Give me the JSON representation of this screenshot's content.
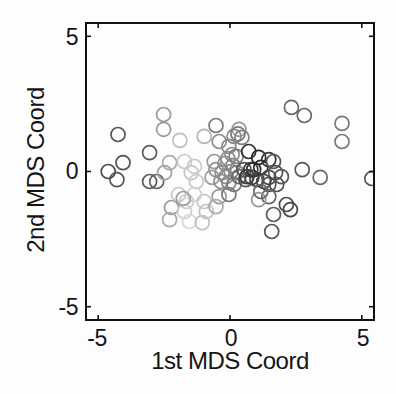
{
  "chart_data": {
    "type": "scatter",
    "title": "",
    "xlabel": "1st MDS Coord",
    "ylabel": "2nd MDS Coord",
    "xlim": [
      -5.5,
      5.5
    ],
    "ylim": [
      -5.53,
      5.53
    ],
    "x_tick_values": [
      -5,
      0,
      5
    ],
    "y_tick_values": [
      -5,
      0,
      5
    ],
    "x_tick_labels": [
      "-5",
      "0",
      "5"
    ],
    "y_tick_labels": [
      "5",
      "0",
      "-5"
    ],
    "grid": false,
    "legend": "none",
    "marker": "open-circle",
    "marker_radius_px": 7,
    "marker_stroke_px": 1.7,
    "box": true,
    "axis_color": "#111111",
    "background_color": "#fdfdfd",
    "shade_meaning": "grayscale gradient per point, light gray (center-left cluster) to near-black (right-of-center cluster)",
    "points": [
      {
        "x": -4.25,
        "y": 1.37,
        "c": "#565656"
      },
      {
        "x": -4.62,
        "y": 0.0,
        "c": "#4d4d4d"
      },
      {
        "x": -4.29,
        "y": -0.3,
        "c": "#575757"
      },
      {
        "x": -4.06,
        "y": 0.33,
        "c": "#535353"
      },
      {
        "x": -3.05,
        "y": 0.7,
        "c": "#5c5c5c"
      },
      {
        "x": -3.05,
        "y": -0.37,
        "c": "#5a5a5a"
      },
      {
        "x": -2.78,
        "y": -0.37,
        "c": "#626262"
      },
      {
        "x": -2.52,
        "y": 2.11,
        "c": "#9c9c9c"
      },
      {
        "x": -2.52,
        "y": 1.56,
        "c": "#989898"
      },
      {
        "x": -1.9,
        "y": 1.15,
        "c": "#bfbfbf"
      },
      {
        "x": -2.29,
        "y": 0.33,
        "c": "#ababab"
      },
      {
        "x": -1.73,
        "y": 0.37,
        "c": "#cccccc"
      },
      {
        "x": -1.35,
        "y": 0.19,
        "c": "#cacaca"
      },
      {
        "x": -2.48,
        "y": -0.04,
        "c": "#a3a3a3"
      },
      {
        "x": -1.47,
        "y": -0.04,
        "c": "#c6c6c6"
      },
      {
        "x": -1.28,
        "y": -0.37,
        "c": "#c9c9c9"
      },
      {
        "x": -1.35,
        "y": -0.85,
        "c": "#d3d3d3"
      },
      {
        "x": -1.65,
        "y": -1.11,
        "c": "#cdcdcd"
      },
      {
        "x": -0.98,
        "y": -1.11,
        "c": "#c7c7c7"
      },
      {
        "x": -2.22,
        "y": -1.33,
        "c": "#9a9a9a"
      },
      {
        "x": -1.73,
        "y": -1.48,
        "c": "#d0d0d0"
      },
      {
        "x": -0.9,
        "y": -1.48,
        "c": "#c4c4c4"
      },
      {
        "x": -2.29,
        "y": -1.78,
        "c": "#ababab"
      },
      {
        "x": -1.54,
        "y": -1.85,
        "c": "#d8d8d8"
      },
      {
        "x": -1.05,
        "y": -1.89,
        "c": "#c2c2c2"
      },
      {
        "x": -1.95,
        "y": -0.85,
        "c": "#c8c8c8"
      },
      {
        "x": -1.77,
        "y": -1.0,
        "c": "#9e9e9e"
      },
      {
        "x": -0.53,
        "y": 1.7,
        "c": "#7a7a7a"
      },
      {
        "x": -0.98,
        "y": 1.3,
        "c": "#b5b5b5"
      },
      {
        "x": 0.34,
        "y": 1.56,
        "c": "#999999"
      },
      {
        "x": 0.15,
        "y": 1.3,
        "c": "#8a8a8a"
      },
      {
        "x": 0.3,
        "y": 1.39,
        "c": "#7b7b7b"
      },
      {
        "x": -0.41,
        "y": 1.11,
        "c": "#8d8d8d"
      },
      {
        "x": -0.04,
        "y": 0.93,
        "c": "#898989"
      },
      {
        "x": 0.45,
        "y": 1.26,
        "c": "#828282"
      },
      {
        "x": 0.08,
        "y": 0.63,
        "c": "#8c8c8c"
      },
      {
        "x": -0.6,
        "y": 0.37,
        "c": "#9a9a9a"
      },
      {
        "x": -0.53,
        "y": 0.07,
        "c": "#929292"
      },
      {
        "x": -0.3,
        "y": -0.04,
        "c": "#8b8b8b"
      },
      {
        "x": 0.04,
        "y": 0.0,
        "c": "#888888"
      },
      {
        "x": 0.26,
        "y": -0.04,
        "c": "#818181"
      },
      {
        "x": -0.68,
        "y": -0.22,
        "c": "#9b9b9b"
      },
      {
        "x": -0.34,
        "y": -0.37,
        "c": "#919191"
      },
      {
        "x": -0.04,
        "y": -0.41,
        "c": "#898989"
      },
      {
        "x": -0.15,
        "y": -0.19,
        "c": "#8c8c8c"
      },
      {
        "x": -0.19,
        "y": 0.3,
        "c": "#8f8f8f"
      },
      {
        "x": 0.11,
        "y": 0.22,
        "c": "#858585"
      },
      {
        "x": -0.08,
        "y": 0.48,
        "c": "#909090"
      },
      {
        "x": 0.23,
        "y": 0.56,
        "c": "#7f7f7f"
      },
      {
        "x": -0.41,
        "y": -0.93,
        "c": "#9a9a9a"
      },
      {
        "x": -0.53,
        "y": -1.3,
        "c": "#ababab"
      },
      {
        "x": -0.04,
        "y": -0.85,
        "c": "#7a7a7a"
      },
      {
        "x": 0.15,
        "y": -0.48,
        "c": "#787878"
      },
      {
        "x": 0.34,
        "y": -0.19,
        "c": "#6b6b6b"
      },
      {
        "x": 0.53,
        "y": 0.07,
        "c": "#575757"
      },
      {
        "x": 0.79,
        "y": 0.07,
        "c": "#3c3c3c"
      },
      {
        "x": 0.6,
        "y": -0.3,
        "c": "#565656"
      },
      {
        "x": 0.83,
        "y": -0.22,
        "c": "#474747"
      },
      {
        "x": 0.71,
        "y": 0.74,
        "c": "#343434"
      },
      {
        "x": 1.09,
        "y": 0.52,
        "c": "#292929"
      },
      {
        "x": 0.9,
        "y": 0.07,
        "c": "#303030"
      },
      {
        "x": 0.64,
        "y": -0.19,
        "c": "#3b3b3b"
      },
      {
        "x": 1.17,
        "y": 0.15,
        "c": "#2b2b2b"
      },
      {
        "x": 1.02,
        "y": -0.3,
        "c": "#454545"
      },
      {
        "x": 1.47,
        "y": 0.44,
        "c": "#393939"
      },
      {
        "x": 1.65,
        "y": 0.37,
        "c": "#565656"
      },
      {
        "x": 1.73,
        "y": -0.04,
        "c": "#555555"
      },
      {
        "x": 1.95,
        "y": -0.19,
        "c": "#595959"
      },
      {
        "x": 1.47,
        "y": -0.22,
        "c": "#4c4c4c"
      },
      {
        "x": 1.47,
        "y": -0.48,
        "c": "#565656"
      },
      {
        "x": 1.77,
        "y": -0.48,
        "c": "#515151"
      },
      {
        "x": 1.28,
        "y": -0.37,
        "c": "#454545"
      },
      {
        "x": 2.14,
        "y": -1.22,
        "c": "#4b4b4b"
      },
      {
        "x": 2.29,
        "y": -1.41,
        "c": "#454545"
      },
      {
        "x": 1.58,
        "y": -2.22,
        "c": "#555555"
      },
      {
        "x": 1.47,
        "y": -0.93,
        "c": "#666666"
      },
      {
        "x": 1.65,
        "y": -1.59,
        "c": "#5c5c5c"
      },
      {
        "x": 1.09,
        "y": -1.04,
        "c": "#999999"
      },
      {
        "x": 1.17,
        "y": -0.74,
        "c": "#676767"
      },
      {
        "x": 2.33,
        "y": 2.37,
        "c": "#676767"
      },
      {
        "x": 2.82,
        "y": 2.07,
        "c": "#696969"
      },
      {
        "x": 4.25,
        "y": 1.78,
        "c": "#787878"
      },
      {
        "x": 4.25,
        "y": 1.11,
        "c": "#7a7a7a"
      },
      {
        "x": 2.74,
        "y": 0.07,
        "c": "#585858"
      },
      {
        "x": 3.42,
        "y": -0.22,
        "c": "#686868"
      },
      {
        "x": 5.38,
        "y": -0.26,
        "c": "#575757"
      }
    ]
  }
}
